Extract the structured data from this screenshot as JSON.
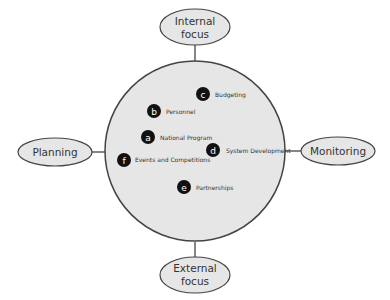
{
  "diagram": {
    "axes": {
      "top": {
        "line1": "Internal",
        "line2": "focus"
      },
      "bottom": {
        "line1": "External",
        "line2": "focus"
      },
      "left": {
        "label": "Planning"
      },
      "right": {
        "label": "Monitoring"
      }
    },
    "nodes": [
      {
        "letter": "a",
        "label": "National Program"
      },
      {
        "letter": "b",
        "label": "Personnel"
      },
      {
        "letter": "c",
        "label": "Budgeting"
      },
      {
        "letter": "d",
        "label": "System Development"
      },
      {
        "letter": "e",
        "label": "Partnerships"
      },
      {
        "letter": "f",
        "label": "Events and Competitions"
      }
    ],
    "colors": {
      "circle_fill": "#e6e6e6",
      "stroke": "#444444",
      "node_fill": "#111111"
    }
  }
}
